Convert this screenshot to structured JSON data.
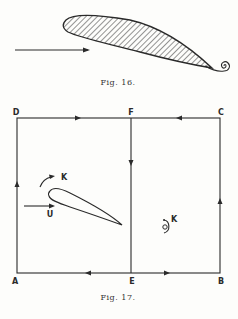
{
  "figure16": {
    "caption": "Fig. 16.",
    "description": "Hatched aerofoil with flow arrow from left and a trailing vortex spiral at the trailing edge"
  },
  "figure17": {
    "caption": "Fig. 17.",
    "corner_labels": {
      "top_left": "D",
      "top_middle": "F",
      "top_right": "C",
      "bottom_left": "A",
      "bottom_middle": "E",
      "bottom_right": "B"
    },
    "aerofoil_circulation_label": "K",
    "flow_label": "U",
    "vortex_label": "K"
  },
  "colors": {
    "ink": "#2a2a2a",
    "paper": "#fdfdfb"
  }
}
